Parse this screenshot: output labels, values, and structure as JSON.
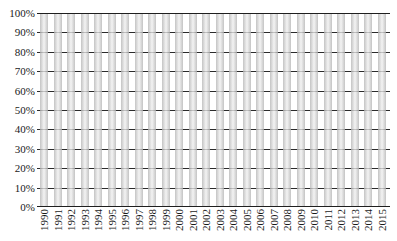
{
  "chart_data": {
    "type": "bar",
    "subtype": "100-percent-stacked-column",
    "title": "",
    "xlabel": "",
    "ylabel": "",
    "categories": [
      "1990",
      "1991",
      "1992",
      "1993",
      "1994",
      "1995",
      "1996",
      "1997",
      "1998",
      "1999",
      "2000",
      "2001",
      "2002",
      "2003",
      "2004",
      "2005",
      "2006",
      "2007",
      "2008",
      "2009",
      "2010",
      "2011",
      "2012",
      "2013",
      "2014",
      "2015"
    ],
    "values": [
      100,
      100,
      100,
      100,
      100,
      100,
      100,
      100,
      100,
      100,
      100,
      100,
      100,
      100,
      100,
      100,
      100,
      100,
      100,
      100,
      100,
      100,
      100,
      100,
      100,
      100
    ],
    "y_axis": {
      "min": 0,
      "max": 100,
      "unit": "%",
      "tick_labels_top_to_bottom": [
        "100%",
        "90%",
        "80%",
        "70%",
        "60%",
        "50%",
        "40%",
        "30%",
        "20%",
        "10%",
        "0%"
      ]
    },
    "grid": true,
    "legend": false,
    "colors": {
      "bar_edge": "#b3b3b3",
      "bar_center": "#eaeaea",
      "gridline": "#2b2b2b",
      "axis_line": "#1f1f1f",
      "background": "#ffffff",
      "text": "#1a1a1a"
    }
  }
}
